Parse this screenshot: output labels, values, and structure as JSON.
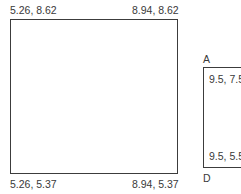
{
  "diagram": {
    "large_box": {
      "top_left": "5.26, 8.62",
      "top_right": "8.94, 8.62",
      "bottom_left": "5.26, 5.37",
      "bottom_right": "8.94, 5.37"
    },
    "small_box": {
      "label_top": "A",
      "label_bottom": "D",
      "top_left": "9.5, 7.5",
      "bottom_left": "9.5, 5.5"
    },
    "colors": {
      "stroke": "#3c3c3c",
      "text": "#3a3a3a",
      "background": "#ffffff"
    }
  }
}
